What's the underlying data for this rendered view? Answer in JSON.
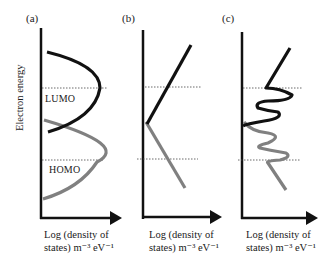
{
  "figure": {
    "y_axis_label": "Electron energy",
    "panels": [
      {
        "id": "a",
        "label": "(a)",
        "x_label_line1": "Log (density of",
        "x_label_line2": "states) m⁻³ eV⁻¹",
        "lumo_label": "LUMO",
        "homo_label": "HOMO",
        "description": "Parabolic-like bands: LUMO (black) and HOMO (grey)"
      },
      {
        "id": "b",
        "label": "(b)",
        "x_label_line1": "Log (density of",
        "x_label_line2": "states) m⁻³ eV⁻¹",
        "description": "Linear (exponential) tails meeting at a common point"
      },
      {
        "id": "c",
        "label": "(c)",
        "x_label_line1": "Log (density of",
        "x_label_line2": "states) m⁻³ eV⁻¹",
        "description": "Linear tails with oscillating trap-state features"
      }
    ],
    "colors": {
      "lumo": "#111111",
      "homo": "#808080",
      "axis": "#111111",
      "dotted": "#444444"
    }
  }
}
